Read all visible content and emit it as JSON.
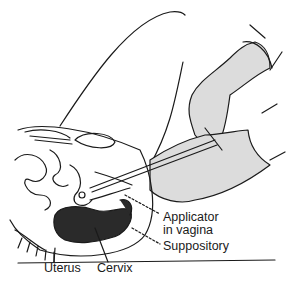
{
  "figure": {
    "labels": {
      "applicator": "Applicator",
      "applicator_line2": "in vagina",
      "suppository": "Suppository",
      "uterus": "Uterus",
      "cervix": "Cervix"
    },
    "colors": {
      "line": "#1a1a1a",
      "glove_fill": "#d9d9d9",
      "tissue_dark": "#2a2a2a",
      "background": "#ffffff"
    }
  }
}
